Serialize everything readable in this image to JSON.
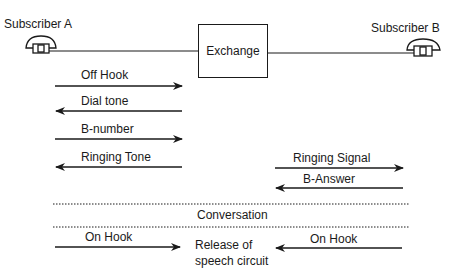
{
  "diagram": {
    "type": "sequence",
    "nodes": {
      "subscriber_a": {
        "label": "Subscriber A",
        "icon": "telephone-icon"
      },
      "exchange": {
        "label": "Exchange"
      },
      "subscriber_b": {
        "label": "Subscriber B",
        "icon": "telephone-icon"
      }
    },
    "messages": [
      {
        "label": "Off Hook",
        "from": "Subscriber A",
        "to": "Exchange",
        "direction": "right"
      },
      {
        "label": "Dial tone",
        "from": "Exchange",
        "to": "Subscriber A",
        "direction": "left"
      },
      {
        "label": "B-number",
        "from": "Subscriber A",
        "to": "Exchange",
        "direction": "right"
      },
      {
        "label": "Ringing Tone",
        "from": "Exchange",
        "to": "Subscriber A",
        "direction": "left"
      },
      {
        "label": "Ringing Signal",
        "from": "Exchange",
        "to": "Subscriber B",
        "direction": "right"
      },
      {
        "label": "B-Answer",
        "from": "Subscriber B",
        "to": "Exchange",
        "direction": "left"
      }
    ],
    "phase": {
      "label": "Conversation"
    },
    "release": {
      "a_label": "On Hook",
      "b_label": "On Hook",
      "center_line1": "Release of",
      "center_line2": "speech circuit"
    }
  },
  "colors": {
    "ink": "#1a1a1a",
    "background": "#ffffff"
  }
}
